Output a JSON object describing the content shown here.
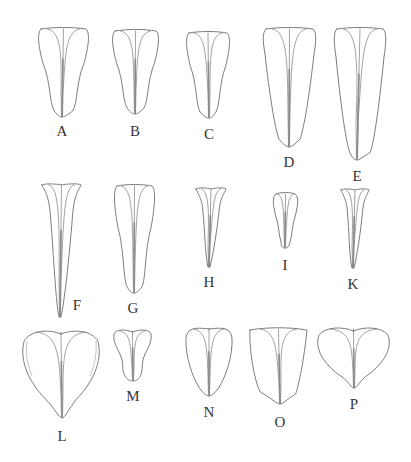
{
  "figure": {
    "colors": {
      "line": "#6e6e6e",
      "label": "#333333",
      "background": "#ffffff"
    },
    "petals": [
      {
        "id": "A",
        "label": "A",
        "row": 1,
        "top_left": 38,
        "top_right": 89,
        "top_y": 28,
        "tip_x": 62,
        "tip_y": 117,
        "label_x": 62,
        "label_y": 136,
        "shape": "spatulate"
      },
      {
        "id": "B",
        "label": "B",
        "row": 1,
        "top_left": 112,
        "top_right": 159,
        "top_y": 30,
        "tip_x": 135,
        "tip_y": 114,
        "label_x": 135,
        "label_y": 136,
        "shape": "spatulate"
      },
      {
        "id": "C",
        "label": "C",
        "row": 1,
        "top_left": 186,
        "top_right": 230,
        "top_y": 32,
        "tip_x": 209,
        "tip_y": 118,
        "label_x": 209,
        "label_y": 139,
        "shape": "spatulate"
      },
      {
        "id": "D",
        "label": "D",
        "row": 1,
        "top_left": 263,
        "top_right": 316,
        "top_y": 28,
        "tip_x": 289,
        "tip_y": 147,
        "label_x": 289,
        "label_y": 167,
        "shape": "oblanceolate"
      },
      {
        "id": "E",
        "label": "E",
        "row": 1,
        "top_left": 334,
        "top_right": 386,
        "top_y": 28,
        "tip_x": 357,
        "tip_y": 160,
        "label_x": 357,
        "label_y": 181,
        "shape": "oblanceolate"
      },
      {
        "id": "F",
        "label": "F",
        "row": 2,
        "top_left": 42,
        "top_right": 81,
        "top_y": 184,
        "tip_x": 60,
        "tip_y": 317,
        "label_x": 77,
        "label_y": 310,
        "shape": "narrow-cuneate"
      },
      {
        "id": "G",
        "label": "G",
        "row": 2,
        "top_left": 114,
        "top_right": 155,
        "top_y": 185,
        "tip_x": 134,
        "tip_y": 293,
        "label_x": 133,
        "label_y": 313,
        "shape": "spatulate"
      },
      {
        "id": "H",
        "label": "H",
        "row": 2,
        "top_left": 196,
        "top_right": 226,
        "top_y": 188,
        "tip_x": 209,
        "tip_y": 267,
        "label_x": 209,
        "label_y": 287,
        "shape": "narrow-cuneate"
      },
      {
        "id": "I",
        "label": "I",
        "row": 2,
        "top_left": 273,
        "top_right": 298,
        "top_y": 193,
        "tip_x": 285,
        "tip_y": 248,
        "label_x": 285,
        "label_y": 270,
        "shape": "spatulate"
      },
      {
        "id": "K",
        "label": "K",
        "row": 2,
        "top_left": 341,
        "top_right": 369,
        "top_y": 189,
        "tip_x": 353,
        "tip_y": 268,
        "label_x": 353,
        "label_y": 289,
        "shape": "narrow-cuneate"
      },
      {
        "id": "L",
        "label": "L",
        "row": 3,
        "top_left": 22,
        "top_right": 100,
        "top_y": 331,
        "tip_x": 62,
        "tip_y": 418,
        "label_x": 62,
        "label_y": 441,
        "shape": "obcordate"
      },
      {
        "id": "M",
        "label": "M",
        "row": 3,
        "top_left": 113,
        "top_right": 152,
        "top_y": 330,
        "tip_x": 133,
        "tip_y": 381,
        "label_x": 133,
        "label_y": 401,
        "shape": "spatulate-short"
      },
      {
        "id": "N",
        "label": "N",
        "row": 3,
        "top_left": 185,
        "top_right": 233,
        "top_y": 328,
        "tip_x": 209,
        "tip_y": 396,
        "label_x": 209,
        "label_y": 417,
        "shape": "obovate"
      },
      {
        "id": "O",
        "label": "O",
        "row": 3,
        "top_left": 250,
        "top_right": 307,
        "top_y": 328,
        "tip_x": 280,
        "tip_y": 404,
        "label_x": 280,
        "label_y": 427,
        "shape": "cuneate"
      },
      {
        "id": "P",
        "label": "P",
        "row": 3,
        "top_left": 317,
        "top_right": 390,
        "top_y": 328,
        "tip_x": 354,
        "tip_y": 388,
        "label_x": 354,
        "label_y": 409,
        "shape": "obcordate-wide"
      }
    ]
  }
}
